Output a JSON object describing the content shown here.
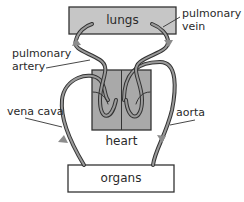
{
  "diagram": {
    "title": "",
    "nodes": {
      "lungs": {
        "label": "lungs",
        "fill": "#c6c6c6"
      },
      "heart": {
        "label": "heart",
        "fill": "#a9a9a9"
      },
      "organs": {
        "label": "organs",
        "fill": "#ffffff"
      }
    },
    "vessels": {
      "pulmonary_vein": {
        "label_line1": "pulmonary",
        "label_line2": "vein"
      },
      "pulmonary_artery": {
        "label_line1": "pulmonary",
        "label_line2": "artery"
      },
      "vena_cava": {
        "label": "vena cava"
      },
      "aorta": {
        "label": "aorta"
      }
    },
    "colors": {
      "stroke": "#333333",
      "vessel_fill": "#9a9a9a",
      "arrow": "#8c8c8c"
    }
  }
}
